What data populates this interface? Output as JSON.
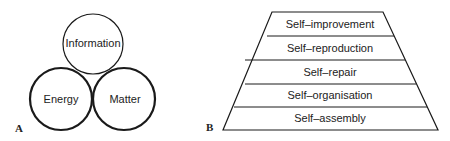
{
  "panel_a": {
    "label": "A",
    "circles": [
      {
        "label": "Information",
        "cx": 93,
        "cy": 44,
        "r": 30,
        "stroke_width": 1.2
      },
      {
        "label": "Energy",
        "cx": 61,
        "cy": 99,
        "r": 31,
        "stroke_width": 2.2
      },
      {
        "label": "Matter",
        "cx": 124,
        "cy": 99,
        "r": 31,
        "stroke_width": 2.2
      }
    ]
  },
  "panel_b": {
    "label": "B",
    "layers_top_to_bottom": [
      "Self–improvement",
      "Self–reproduction",
      "Self–repair",
      "Self–organisation",
      "Self–assembly"
    ]
  },
  "colors": {
    "stroke": "#1a1a1a",
    "background": "#ffffff"
  }
}
